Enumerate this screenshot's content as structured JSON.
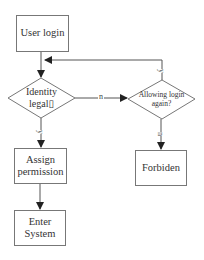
{
  "diagram": {
    "type": "flowchart",
    "nodes": {
      "user_login": {
        "label": "User login",
        "shape": "rectangle"
      },
      "identity_legal": {
        "label_line1": "Identity",
        "label_line2": "legal▯",
        "shape": "diamond"
      },
      "allowing_login_again": {
        "label_line1": "Allowing login",
        "label_line2": "again?",
        "shape": "diamond"
      },
      "assign_permission": {
        "label_line1": "Assign",
        "label_line2": "permission",
        "shape": "rectangle"
      },
      "enter_system": {
        "label_line1": "Enter",
        "label_line2": "System",
        "shape": "rectangle"
      },
      "forbiden": {
        "label": "Forbiden",
        "shape": "rectangle"
      }
    },
    "edges": [
      {
        "from": "user_login",
        "to": "identity_legal",
        "label": ""
      },
      {
        "from": "identity_legal",
        "to": "allowing_login_again",
        "label": "n"
      },
      {
        "from": "identity_legal",
        "to": "assign_permission",
        "label": "y"
      },
      {
        "from": "allowing_login_again",
        "to": "user_login",
        "label": "y"
      },
      {
        "from": "allowing_login_again",
        "to": "forbiden",
        "label": "n"
      },
      {
        "from": "assign_permission",
        "to": "enter_system",
        "label": ""
      }
    ],
    "edge_labels": {
      "identity_no": "n",
      "identity_yes": "y",
      "allow_yes": "y",
      "allow_no": "n"
    },
    "colors": {
      "line": "#555555",
      "border": "#777777",
      "text": "#333333",
      "background": "#ffffff"
    }
  }
}
